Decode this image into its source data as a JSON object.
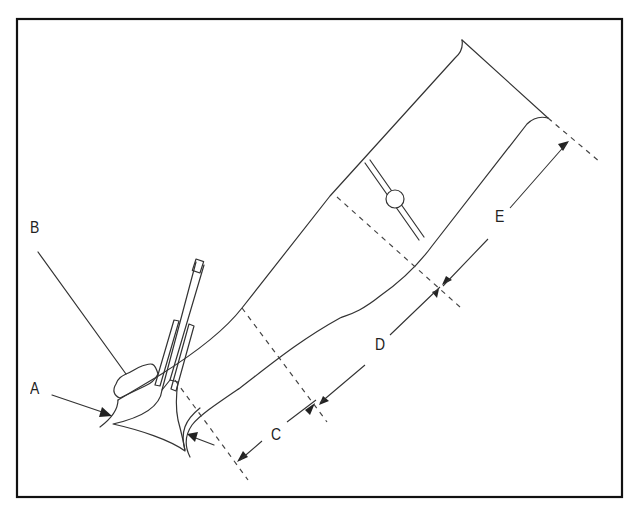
{
  "diagram": {
    "type": "technical-illustration",
    "stroke_color": "#333333",
    "frame_color": "#111111",
    "background": "#ffffff",
    "labels": {
      "A": "A",
      "B": "B",
      "C": "C",
      "D": "D",
      "E": "E"
    },
    "dimensions": [
      {
        "id": "C",
        "label": "C",
        "description": "first section length from valve seat"
      },
      {
        "id": "D",
        "label": "D",
        "description": "middle section length"
      },
      {
        "id": "E",
        "label": "E",
        "description": "outer runner section length"
      }
    ],
    "callouts": [
      {
        "id": "A",
        "label": "A",
        "points_to": "valve seat area (left)"
      },
      {
        "id": "B",
        "label": "B",
        "points_to": "valve guide boss"
      }
    ]
  }
}
